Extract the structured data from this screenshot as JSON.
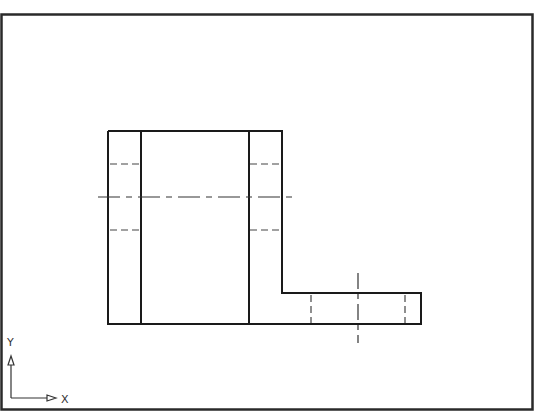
{
  "view": {
    "type": "orthographic-top-view",
    "colors": {
      "object_line": "#1a1a1a",
      "hidden_line": "#444444",
      "center_line": "#333333",
      "border": "#2a2a2a",
      "background": "#ffffff"
    }
  },
  "ucs_icon": {
    "x_label": "X",
    "y_label": "Y"
  },
  "geometry": {
    "border": {
      "x1": 1,
      "y1": 14,
      "x2": 533,
      "y2": 410
    },
    "outline": [
      [
        108,
        131
      ],
      [
        282,
        131
      ],
      [
        282,
        293
      ],
      [
        421,
        293
      ],
      [
        421,
        324
      ],
      [
        108,
        324
      ],
      [
        108,
        131
      ]
    ],
    "inner_lines": [
      {
        "x1": 141,
        "y1": 131,
        "x2": 141,
        "y2": 324
      },
      {
        "x1": 249,
        "y1": 131,
        "x2": 249,
        "y2": 324
      }
    ],
    "hidden_lines": [
      {
        "x1": 108,
        "y1": 164,
        "x2": 141,
        "y2": 164
      },
      {
        "x1": 108,
        "y1": 230,
        "x2": 141,
        "y2": 230
      },
      {
        "x1": 249,
        "y1": 164,
        "x2": 282,
        "y2": 164
      },
      {
        "x1": 249,
        "y1": 230,
        "x2": 282,
        "y2": 230
      },
      {
        "x1": 311,
        "y1": 293,
        "x2": 311,
        "y2": 324
      },
      {
        "x1": 405,
        "y1": 293,
        "x2": 405,
        "y2": 324
      }
    ],
    "center_lines": [
      {
        "x1": 98,
        "y1": 197,
        "x2": 294,
        "y2": 197
      },
      {
        "x1": 358,
        "y1": 273,
        "x2": 358,
        "y2": 343
      }
    ]
  }
}
